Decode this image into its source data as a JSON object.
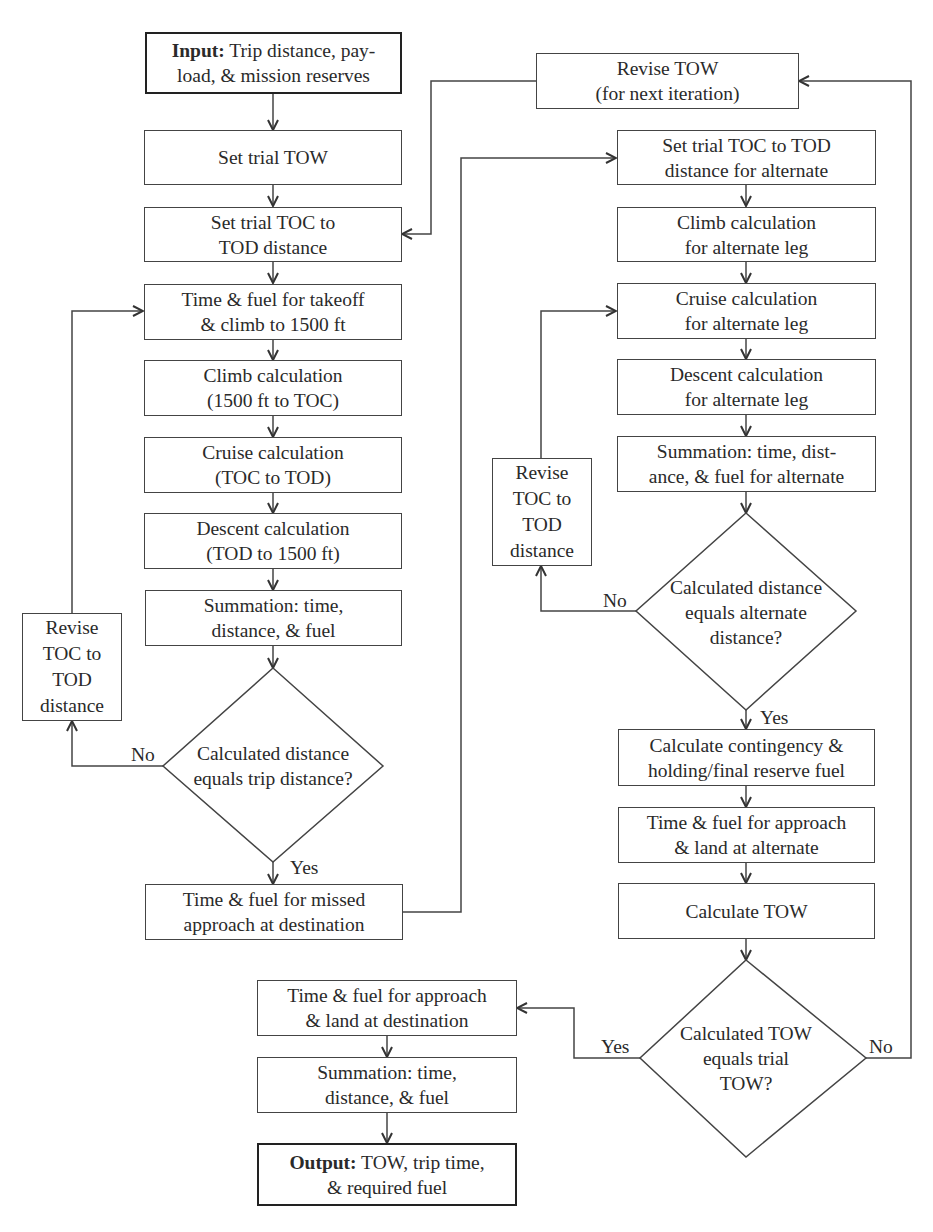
{
  "flowchart": {
    "input": {
      "bold": "Input:",
      "line1_rest": " Trip distance, pay-",
      "line2": "load, & mission reserves"
    },
    "set_trial_tow": {
      "line1": "Set trial TOW"
    },
    "set_trial_toc": {
      "line1": "Set trial TOC to",
      "line2": "TOD distance"
    },
    "takeoff": {
      "line1": "Time & fuel for takeoff",
      "line2": "& climb to 1500 ft"
    },
    "climb": {
      "line1": "Climb calculation",
      "line2": "(1500 ft to TOC)"
    },
    "cruise": {
      "line1": "Cruise calculation",
      "line2": "(TOC to TOD)"
    },
    "descent": {
      "line1": "Descent calculation",
      "line2": "(TOD to 1500 ft)"
    },
    "summation1": {
      "line1": "Summation: time,",
      "line2": "distance, & fuel"
    },
    "revise_toc1": {
      "line1": "Revise",
      "line2": "TOC to",
      "line3": "TOD",
      "line4": "distance"
    },
    "decision1": {
      "line1": "Calculated",
      "line2": "distance equals",
      "line3": "trip distance?",
      "no": "No",
      "yes": "Yes"
    },
    "missed_approach": {
      "line1": "Time & fuel for missed",
      "line2": "approach at destination"
    },
    "revise_tow": {
      "line1": "Revise TOW",
      "line2": "(for next iteration)"
    },
    "set_trial_toc_alt": {
      "line1": "Set trial TOC to TOD",
      "line2": "distance for alternate"
    },
    "climb_alt": {
      "line1": "Climb calculation",
      "line2": "for alternate leg"
    },
    "cruise_alt": {
      "line1": "Cruise calculation",
      "line2": "for alternate leg"
    },
    "descent_alt": {
      "line1": "Descent calculation",
      "line2": "for alternate leg"
    },
    "summation_alt": {
      "line1": "Summation: time, dist-",
      "line2": "ance, & fuel for alternate"
    },
    "revise_toc2": {
      "line1": "Revise",
      "line2": "TOC to",
      "line3": "TOD",
      "line4": "distance"
    },
    "decision2": {
      "line1": "Calculated",
      "line2": "distance equals",
      "line3": "alternate",
      "line4": "distance?",
      "no": "No",
      "yes": "Yes"
    },
    "contingency": {
      "line1": "Calculate contingency &",
      "line2": "holding/final reserve fuel"
    },
    "approach_alt": {
      "line1": "Time & fuel for approach",
      "line2": "& land at alternate"
    },
    "calc_tow": {
      "line1": "Calculate TOW"
    },
    "decision3": {
      "line1": "Calculated",
      "line2": "TOW equals",
      "line3": "trial TOW?",
      "no": "No",
      "yes": "Yes"
    },
    "approach_dest": {
      "line1": "Time & fuel for approach",
      "line2": "& land at destination"
    },
    "summation_final": {
      "line1": "Summation: time,",
      "line2": "distance, & fuel"
    },
    "output": {
      "bold": "Output:",
      "line1_rest": " TOW, trip time,",
      "line2": "& required fuel"
    }
  },
  "colors": {
    "stroke": "#444444",
    "text": "#2a2a2a",
    "background": "#ffffff"
  }
}
